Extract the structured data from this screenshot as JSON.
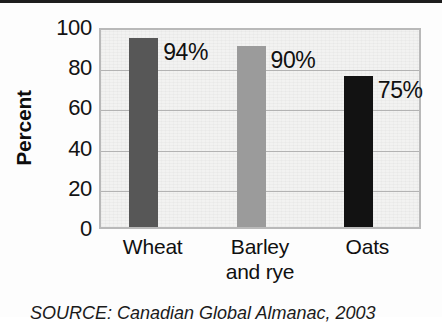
{
  "chart_data": {
    "type": "bar",
    "title": "",
    "subtitle": "",
    "xlabel": "",
    "ylabel": "Percent",
    "categories": [
      "Wheat",
      "Barley and rye",
      "Oats"
    ],
    "category_lines": [
      [
        "Wheat"
      ],
      [
        "Barley",
        "and rye"
      ],
      [
        "Oats"
      ]
    ],
    "values": [
      94,
      90,
      75
    ],
    "value_labels": [
      "94%",
      "90%",
      "75%"
    ],
    "bar_colors": [
      "#575757",
      "#9b9b9b",
      "#121212"
    ],
    "ylim": [
      0,
      100
    ],
    "yticks": [
      100,
      80,
      60,
      40,
      20,
      0
    ],
    "ytick_labels": [
      "100",
      "80",
      "60",
      "40",
      "20",
      "0"
    ],
    "gridlines": [
      80,
      60,
      40,
      20
    ],
    "grid": true,
    "legend": false,
    "legend_position": "none",
    "plot_background": "#f2f2f1",
    "gridline_color": "#b3b3b3",
    "plot_border_color": "#b9b9b9"
  },
  "source_note": "SOURCE: Canadian Global Almanac, 2003"
}
